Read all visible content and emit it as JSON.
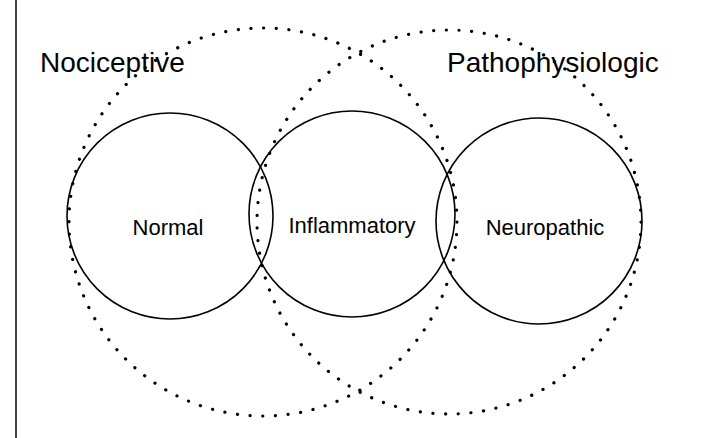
{
  "diagram": {
    "type": "venn",
    "outer_sets": [
      {
        "id": "nociceptive",
        "label": "Nociceptive",
        "style": "dotted"
      },
      {
        "id": "pathophysiologic",
        "label": "Pathophysiologic",
        "style": "dotted"
      }
    ],
    "inner_sets": [
      {
        "id": "normal",
        "label": "Normal",
        "style": "solid",
        "member_of": [
          "nociceptive"
        ]
      },
      {
        "id": "inflammatory",
        "label": "Inflammatory",
        "style": "solid",
        "member_of": [
          "nociceptive",
          "pathophysiologic"
        ]
      },
      {
        "id": "neuropathic",
        "label": "Neuropathic",
        "style": "solid",
        "member_of": [
          "pathophysiologic"
        ]
      }
    ],
    "colors": {
      "line": "#000000",
      "background": "#ffffff"
    }
  },
  "labels": {
    "nociceptive": "Nociceptive",
    "pathophysiologic": "Pathophysiologic",
    "normal": "Normal",
    "inflammatory": "Inflammatory",
    "neuropathic": "Neuropathic"
  }
}
